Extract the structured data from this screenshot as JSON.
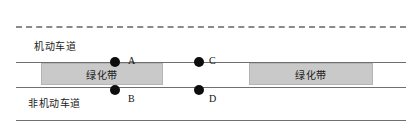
{
  "diagram": {
    "colors": {
      "line": "#6f6f6f",
      "dashed_line": "#8a8a8a",
      "belt_fill": "#c9c9c9",
      "belt_border": "#b4b4b4",
      "point": "#0d0d0d",
      "text": "#1a1a1a",
      "background": "#ffffff"
    },
    "lanes": [
      {
        "id": "motor-lane",
        "label": "机动车道"
      },
      {
        "id": "non-motor-lane",
        "label": "非机动车道"
      }
    ],
    "green_belts": [
      {
        "id": "green-belt-left",
        "label": "绿化带"
      },
      {
        "id": "green-belt-right",
        "label": "绿化带"
      }
    ],
    "points": [
      {
        "id": "point-a",
        "label": "A"
      },
      {
        "id": "point-b",
        "label": "B"
      },
      {
        "id": "point-c",
        "label": "C"
      },
      {
        "id": "point-d",
        "label": "D"
      }
    ]
  }
}
